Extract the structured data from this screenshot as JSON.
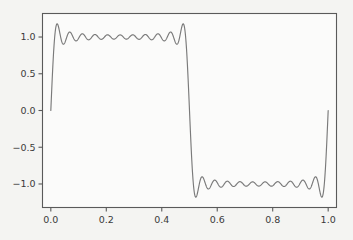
{
  "figure": {
    "background_color": "#f4f4f2",
    "axes_background_color": "#fbfbfa",
    "frame_color": "#5a5a5a",
    "line_color": "#7a7a7a",
    "tick_label_color": "#3a3a3a"
  },
  "chart_data": {
    "type": "line",
    "title": "",
    "subtitle": "",
    "xlabel": "",
    "ylabel": "",
    "xlim": [
      -0.03,
      1.03
    ],
    "ylim": [
      -1.32,
      1.32
    ],
    "grid": false,
    "legend": null,
    "xticks": [
      0.0,
      0.2,
      0.4,
      0.6,
      0.8,
      1.0
    ],
    "xticklabels": [
      "0.0",
      "0.2",
      "0.4",
      "0.6",
      "0.8",
      "1.0"
    ],
    "yticks": [
      -1.0,
      -0.5,
      0.0,
      0.5,
      1.0
    ],
    "yticklabels": [
      "−1.0",
      "−0.5",
      "0.0",
      "0.5",
      "1.0"
    ],
    "series": [
      {
        "name": "partial Fourier sum",
        "color": "#7a7a7a",
        "harmonics": [
          1,
          3,
          5,
          7,
          9,
          11,
          13,
          15,
          17,
          19,
          21
        ],
        "amplitude_scale": 1.2732395447351628,
        "period": 1.0,
        "n_samples": 1200,
        "overshoot_max": 1.179,
        "overshoot_min": -1.179,
        "endpoint_values": [
          0.0,
          0.0
        ],
        "plateau_high": 1.0,
        "plateau_low": -1.0,
        "ripples_per_half_period": 10
      }
    ]
  }
}
